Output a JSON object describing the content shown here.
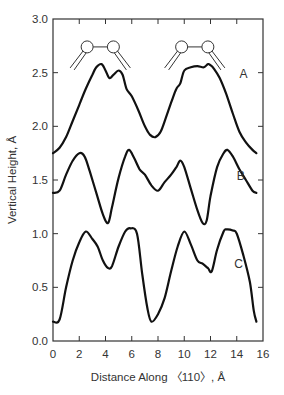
{
  "chart_data": {
    "type": "line",
    "title": "",
    "xlabel": "Distance Along 〈110〉, Å",
    "ylabel": "Vertical Height, Å",
    "xlim": [
      0,
      16
    ],
    "ylim": [
      0.0,
      3.0
    ],
    "x_ticks": [
      "0",
      "2",
      "4",
      "6",
      "8",
      "10",
      "12",
      "14",
      "16"
    ],
    "y_ticks": [
      "0.0",
      "0.5",
      "1.0",
      "1.5",
      "2.0",
      "2.5",
      "3.0"
    ],
    "grid": false,
    "legend": "inline labels",
    "annotations": [
      "two molecule (dimer) schematics above curve A at x≈2.5–4.5 and x≈10–12"
    ],
    "series": [
      {
        "name": "A",
        "label_pos": [
          14.2,
          2.45
        ],
        "x": [
          0,
          0.5,
          1,
          1.5,
          2,
          2.5,
          3,
          3.3,
          3.7,
          4.0,
          4.3,
          4.6,
          5.0,
          5.3,
          5.6,
          6.0,
          6.5,
          7.0,
          7.4,
          7.8,
          8.2,
          8.6,
          9.0,
          9.4,
          9.7,
          10.0,
          10.5,
          11.0,
          11.5,
          11.8,
          12.0,
          12.3,
          12.7,
          13.2,
          13.7,
          14.2,
          14.7,
          15.2,
          15.5
        ],
        "values": [
          1.75,
          1.8,
          1.9,
          2.05,
          2.2,
          2.35,
          2.48,
          2.55,
          2.58,
          2.52,
          2.45,
          2.48,
          2.52,
          2.48,
          2.35,
          2.28,
          2.15,
          2.0,
          1.92,
          1.9,
          1.95,
          2.08,
          2.22,
          2.35,
          2.4,
          2.52,
          2.55,
          2.56,
          2.55,
          2.58,
          2.57,
          2.53,
          2.45,
          2.3,
          2.12,
          1.95,
          1.85,
          1.78,
          1.75
        ]
      },
      {
        "name": "B",
        "label_pos": [
          14.0,
          1.5
        ],
        "x": [
          0,
          0.5,
          1.0,
          1.5,
          2.0,
          2.4,
          2.8,
          3.3,
          3.8,
          4.2,
          4.5,
          5.0,
          5.5,
          5.8,
          6.2,
          6.6,
          7.0,
          7.5,
          8.0,
          8.5,
          9.0,
          9.4,
          9.7,
          10.0,
          10.5,
          11.0,
          11.4,
          11.7,
          12.0,
          12.5,
          13.0,
          13.3,
          13.7,
          14.2,
          14.7,
          15.2,
          15.5
        ],
        "values": [
          1.38,
          1.4,
          1.55,
          1.68,
          1.75,
          1.72,
          1.58,
          1.38,
          1.18,
          1.1,
          1.25,
          1.52,
          1.72,
          1.78,
          1.7,
          1.6,
          1.55,
          1.45,
          1.4,
          1.48,
          1.55,
          1.62,
          1.68,
          1.62,
          1.42,
          1.22,
          1.1,
          1.12,
          1.35,
          1.62,
          1.75,
          1.78,
          1.72,
          1.6,
          1.5,
          1.4,
          1.38
        ]
      },
      {
        "name": "C",
        "label_pos": [
          13.8,
          0.68
        ],
        "x": [
          0,
          0.5,
          1.0,
          1.5,
          2.0,
          2.5,
          3.0,
          3.4,
          3.8,
          4.2,
          4.5,
          5.0,
          5.5,
          5.9,
          6.4,
          6.8,
          7.2,
          7.5,
          8.0,
          8.5,
          9.0,
          9.5,
          10.0,
          10.5,
          11.0,
          11.4,
          11.8,
          12.1,
          12.5,
          13.0,
          13.2,
          13.7,
          14.0,
          14.5,
          15.0,
          15.3,
          15.5
        ],
        "values": [
          0.18,
          0.2,
          0.5,
          0.75,
          0.92,
          1.02,
          0.95,
          0.88,
          0.75,
          0.68,
          0.7,
          0.88,
          1.02,
          1.05,
          1.0,
          0.62,
          0.3,
          0.18,
          0.25,
          0.4,
          0.65,
          0.88,
          1.02,
          0.9,
          0.75,
          0.72,
          0.68,
          0.65,
          0.85,
          1.02,
          1.04,
          1.03,
          1.0,
          0.8,
          0.55,
          0.28,
          0.18
        ]
      }
    ]
  },
  "plot": {
    "x_axis_title": "Distance Along 〈110〉, Å",
    "y_axis_title": "Vertical Height, Å",
    "line_color": "#111111",
    "axis_color": "#333333"
  }
}
